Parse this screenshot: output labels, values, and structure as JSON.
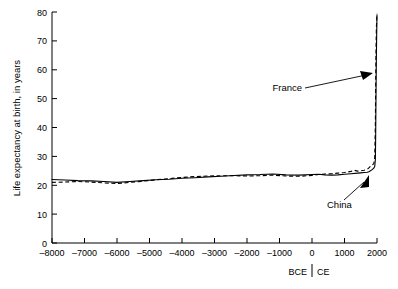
{
  "chart_data": {
    "type": "line",
    "title": "",
    "subtitle": "",
    "xlabel": "",
    "ylabel": "Life expectancy at birth, in years",
    "xlim": [
      -8000,
      2000
    ],
    "ylim": [
      0,
      80
    ],
    "grid": false,
    "legend_position": "none (direct labels with leader arrows)",
    "x_tick_labels": [
      "–8000",
      "–7000",
      "–6000",
      "–5000",
      "–4000",
      "–3000",
      "–2000",
      "–1000",
      "0",
      "1000",
      "2000"
    ],
    "x_tick_values": [
      -8000,
      -7000,
      -6000,
      -5000,
      -4000,
      -3000,
      -2000,
      -1000,
      0,
      1000,
      2000
    ],
    "y_tick_labels": [
      "0",
      "10",
      "20",
      "30",
      "40",
      "50",
      "60",
      "70",
      "80"
    ],
    "y_tick_values": [
      0,
      10,
      20,
      30,
      40,
      50,
      60,
      70,
      80
    ],
    "era_annotation": {
      "bce_label": "BCE",
      "ce_label": "CE",
      "divider_at_x": 0
    },
    "annotations": [
      {
        "text": "France",
        "points_to_series": "France",
        "label_x": -900,
        "label_y": 57,
        "target_x": 1870,
        "target_y": 60
      },
      {
        "text": "China",
        "points_to_series": "China",
        "label_x": 500,
        "label_y": 14,
        "target_x": 1790,
        "target_y": 26
      }
    ],
    "series": [
      {
        "name": "China",
        "style": "solid",
        "x": [
          -8000,
          -7600,
          -7200,
          -6800,
          -6400,
          -6000,
          -5600,
          -5200,
          -4800,
          -4400,
          -4000,
          -3600,
          -3200,
          -2800,
          -2400,
          -2000,
          -1600,
          -1200,
          -800,
          -400,
          0,
          200,
          400,
          600,
          800,
          1000,
          1200,
          1400,
          1500,
          1600,
          1700,
          1750,
          1800,
          1850,
          1900,
          1930,
          1950,
          1960,
          1970,
          1980,
          1990,
          2000
        ],
        "y": [
          22.0,
          21.8,
          21.6,
          21.5,
          21.3,
          21.0,
          21.3,
          21.6,
          21.9,
          22.1,
          22.4,
          22.6,
          22.9,
          23.1,
          23.4,
          23.6,
          23.7,
          23.9,
          23.6,
          23.5,
          23.7,
          23.8,
          23.6,
          23.5,
          23.6,
          23.8,
          24.0,
          24.2,
          24.3,
          24.4,
          24.5,
          24.7,
          25.0,
          25.4,
          25.9,
          26.5,
          29.0,
          38.0,
          52.0,
          64.0,
          72.0,
          79.0
        ]
      },
      {
        "name": "France",
        "style": "dashed",
        "x": [
          -8000,
          -7600,
          -7200,
          -6800,
          -6400,
          -6000,
          -5600,
          -5200,
          -4800,
          -4400,
          -4000,
          -3600,
          -3200,
          -2800,
          -2400,
          -2000,
          -1600,
          -1200,
          -800,
          -400,
          0,
          200,
          400,
          600,
          800,
          1000,
          1200,
          1300,
          1400,
          1500,
          1600,
          1700,
          1750,
          1800,
          1850,
          1900,
          1930,
          1950,
          1960,
          1970,
          1980,
          1990,
          2000
        ],
        "y": [
          21.0,
          21.1,
          21.3,
          21.1,
          20.8,
          20.6,
          21.0,
          21.4,
          21.9,
          22.3,
          22.7,
          23.0,
          23.2,
          23.3,
          23.3,
          23.2,
          23.3,
          23.5,
          23.2,
          23.1,
          23.4,
          23.7,
          23.9,
          24.0,
          24.2,
          24.4,
          24.8,
          25.2,
          24.9,
          25.0,
          25.2,
          25.5,
          26.0,
          26.6,
          27.1,
          27.4,
          29.5,
          42.0,
          56.0,
          67.0,
          74.0,
          77.5,
          79.5
        ]
      }
    ]
  }
}
